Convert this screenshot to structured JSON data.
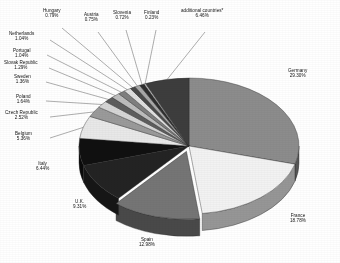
{
  "chart_data": {
    "type": "pie",
    "title": "",
    "subtitle": "",
    "xlabel": "",
    "ylabel": "",
    "legend_position": "none",
    "grid": false,
    "style": "3d-exploded-pie-grayscale",
    "value_suffix": "%",
    "start_angle_deg": 0,
    "direction": "clockwise",
    "footnote_marker": "*",
    "categories": [
      "Germany",
      "France",
      "Spain",
      "U.K.",
      "Italy",
      "Belgium",
      "Czech Republic",
      "Poland",
      "Sweden",
      "Slovak Republic",
      "Portugal",
      "Netherlands",
      "Hungary",
      "Austria",
      "Slovenia",
      "Finland",
      "additional countries*"
    ],
    "values": [
      29.3,
      18.78,
      12.98,
      9.31,
      6.44,
      5.36,
      2.52,
      1.64,
      1.36,
      1.29,
      1.04,
      1.04,
      0.79,
      0.75,
      0.72,
      0.23,
      6.46
    ],
    "slice_colors": [
      "#8c8c8c",
      "#f2f2f2",
      "#757575",
      "#232323",
      "#101010",
      "#e8e8e8",
      "#9a9a9a",
      "#d6d6d6",
      "#5e5e5e",
      "#bdbdbd",
      "#7f7f7f",
      "#e0e0e0",
      "#4a4a4a",
      "#a8a8a8",
      "#2e2e2e",
      "#cfcfcf",
      "#3d3d3d"
    ],
    "slices": [
      {
        "label": "Germany",
        "percent_text": "29.30%",
        "value": 29.3,
        "color": "#8c8c8c"
      },
      {
        "label": "France",
        "percent_text": "18.78%",
        "value": 18.78,
        "color": "#f2f2f2"
      },
      {
        "label": "Spain",
        "percent_text": "12.98%",
        "value": 12.98,
        "color": "#757575"
      },
      {
        "label": "U.K.",
        "percent_text": "9.31%",
        "value": 9.31,
        "color": "#232323"
      },
      {
        "label": "Italy",
        "percent_text": "6.44%",
        "value": 6.44,
        "color": "#101010"
      },
      {
        "label": "Belgium",
        "percent_text": "5.36%",
        "value": 5.36,
        "color": "#e8e8e8"
      },
      {
        "label": "Czech Republic",
        "percent_text": "2.52%",
        "value": 2.52,
        "color": "#9a9a9a"
      },
      {
        "label": "Poland",
        "percent_text": "1.64%",
        "value": 1.64,
        "color": "#d6d6d6"
      },
      {
        "label": "Sweden",
        "percent_text": "1.36%",
        "value": 1.36,
        "color": "#5e5e5e"
      },
      {
        "label": "Slovak Republic",
        "percent_text": "1.29%",
        "value": 1.29,
        "color": "#bdbdbd"
      },
      {
        "label": "Portugal",
        "percent_text": "1.04%",
        "value": 1.04,
        "color": "#7f7f7f"
      },
      {
        "label": "Netherlands",
        "percent_text": "1.04%",
        "value": 1.04,
        "color": "#e0e0e0"
      },
      {
        "label": "Hungary",
        "percent_text": "0.79%",
        "value": 0.79,
        "color": "#4a4a4a"
      },
      {
        "label": "Austria",
        "percent_text": "0.75%",
        "value": 0.75,
        "color": "#a8a8a8"
      },
      {
        "label": "Slovenia",
        "percent_text": "0.72%",
        "value": 0.72,
        "color": "#2e2e2e"
      },
      {
        "label": "Finland",
        "percent_text": "0.23%",
        "value": 0.23,
        "color": "#cfcfcf"
      },
      {
        "label": "additional countries*",
        "percent_text": "6.46%",
        "value": 6.46,
        "color": "#3d3d3d"
      }
    ]
  },
  "labels": {
    "germany": {
      "name": "Germany",
      "pct": "29.30%"
    },
    "france": {
      "name": "France",
      "pct": "18.78%"
    },
    "spain": {
      "name": "Spain",
      "pct": "12.98%"
    },
    "uk": {
      "name": "U.K.",
      "pct": "9.31%"
    },
    "italy": {
      "name": "Italy",
      "pct": "6.44%"
    },
    "belgium": {
      "name": "Belgium",
      "pct": "5.36%"
    },
    "czech": {
      "name": "Czech Republic",
      "pct": "2.52%"
    },
    "poland": {
      "name": "Poland",
      "pct": "1.64%"
    },
    "sweden": {
      "name": "Sweden",
      "pct": "1.36%"
    },
    "slovakia": {
      "name": "Slovak Republic",
      "pct": "1.29%"
    },
    "portugal": {
      "name": "Portugal",
      "pct": "1.04%"
    },
    "netherlands": {
      "name": "Netherlands",
      "pct": "1.04%"
    },
    "hungary": {
      "name": "Hungary",
      "pct": "0.79%"
    },
    "austria": {
      "name": "Austria",
      "pct": "0.75%"
    },
    "slovenia": {
      "name": "Slovenia",
      "pct": "0.72%"
    },
    "finland": {
      "name": "Finland",
      "pct": "0.23%"
    },
    "additional": {
      "name": "additional countries*",
      "pct": "6.46%"
    }
  }
}
